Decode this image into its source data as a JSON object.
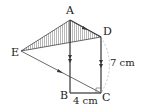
{
  "diagram": {
    "points": {
      "A": {
        "label": "A",
        "x": 70,
        "y": 20
      },
      "B": {
        "label": "B",
        "x": 70,
        "y": 93
      },
      "C": {
        "label": "C",
        "x": 101,
        "y": 93
      },
      "D": {
        "label": "D",
        "x": 101,
        "y": 37
      },
      "E": {
        "label": "E",
        "x": 21,
        "y": 51
      }
    },
    "measurements": {
      "DC": "7 cm",
      "BC": "4 cm"
    },
    "shaded_region": "triangle AED",
    "right_angle_at": "C",
    "colors": {
      "line": "#333333",
      "hatch": "#999999",
      "dashed_arc": "#aaaaaa"
    }
  }
}
